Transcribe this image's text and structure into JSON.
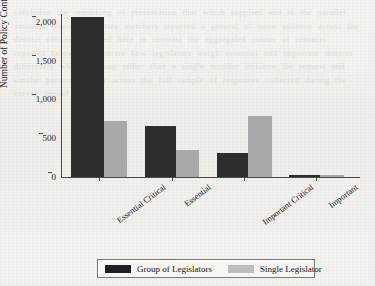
{
  "chart_data": {
    "type": "bar",
    "title": "",
    "xlabel": "",
    "ylabel": "Number of Policy Contacts",
    "categories": [
      "Essential Critical",
      "Essential",
      "Important Critical",
      "Important"
    ],
    "series": [
      {
        "name": "Group of Legislators",
        "color": "#2e2e2e",
        "values": [
          2060,
          660,
          310,
          30
        ]
      },
      {
        "name": "Single Legislator",
        "color": "#a9a9a9",
        "values": [
          720,
          350,
          780,
          30
        ]
      }
    ],
    "ylim": [
      0,
      2100
    ],
    "yticks": [
      0,
      500,
      1000,
      1500,
      2000
    ],
    "ytick_labels": [
      "0",
      "500",
      "1,000",
      "1,500",
      "2,000"
    ],
    "grid": false,
    "legend_position": "bottom"
  },
  "legend": {
    "items": [
      {
        "label": "Group of Legislators",
        "swatch": "dark-swatch-icon"
      },
      {
        "label": "Single Legislator",
        "swatch": "light-swatch-icon"
      }
    ]
  },
  "background": {
    "ghost_text": "cotyledon the remaining of presentation that which supplied and to the parallel amounts where committee members reported a general of issue salience across the district offices reviewed here in contrast the aggregated counts of contacts reported below demonstrate how legislators weigh essential and important matters differently when a group rather than a single member initiates the request and similar patterns appear across the full sample of responses collected during the survey period"
  }
}
